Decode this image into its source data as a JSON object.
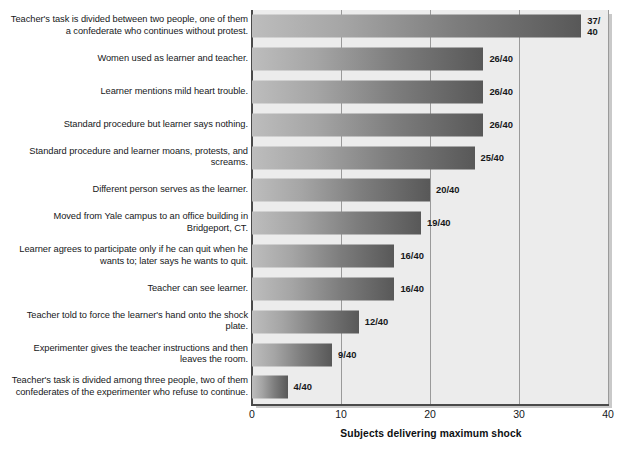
{
  "chart_data": {
    "type": "bar",
    "orientation": "horizontal",
    "title": "",
    "xlabel": "Subjects delivering maximum shock",
    "ylabel": "",
    "xlim": [
      0,
      40
    ],
    "xticks": [
      "0",
      "10",
      "20",
      "30",
      "40"
    ],
    "grid": true,
    "legend": "none",
    "denominator": 40,
    "categories": [
      "Teacher's task is divided between two people, one of them a confederate who continues without protest.",
      "Women used as learner and teacher.",
      "Learner mentions mild heart trouble.",
      "Standard procedure but learner says nothing.",
      "Standard procedure and learner moans, protests, and screams.",
      "Different person serves as the learner.",
      "Moved from Yale campus to an office building in Bridgeport, CT.",
      "Learner agrees to participate only if he can quit when he wants to; later says he wants to quit.",
      "Teacher can see learner.",
      "Teacher told to force the learner's hand onto the shock plate.",
      "Experimenter gives the teacher instructions and then leaves the room.",
      "Teacher's task is divided among three people, two of them confederates of the experimenter who refuse to continue."
    ],
    "values": [
      37,
      26,
      26,
      26,
      25,
      20,
      19,
      16,
      16,
      12,
      9,
      4
    ],
    "value_labels": [
      "37/\n40",
      "26/40",
      "26/40",
      "26/40",
      "25/40",
      "20/40",
      "19/40",
      "16/40",
      "16/40",
      "12/40",
      "9/40",
      "4/40"
    ],
    "colors": {
      "bar_gradient_start": "#bdbdbd",
      "bar_gradient_end": "#585858",
      "plot_background": "#ececec",
      "gridline": "#9a9a9a",
      "axis": "#4a4a4a",
      "text": "#16181a"
    }
  }
}
